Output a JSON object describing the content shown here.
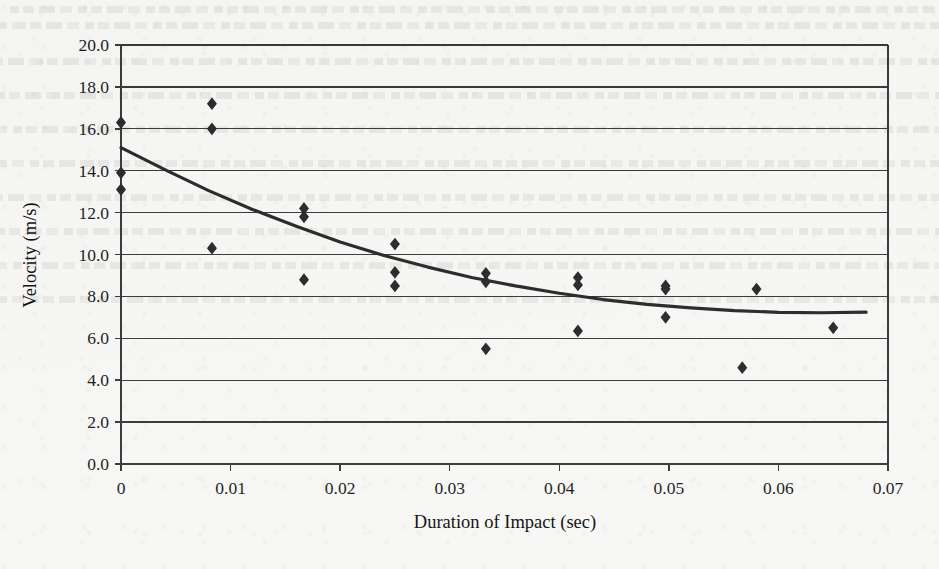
{
  "page": {
    "background_color": "#f7f7f5",
    "ghost_text_note": "faint show-through text from reverse of scanned page"
  },
  "chart_data": {
    "type": "scatter",
    "title": "",
    "xlabel": "Duration of Impact (sec)",
    "ylabel": "Velocity (m/s)",
    "xlim": [
      0,
      0.07
    ],
    "ylim": [
      0,
      20
    ],
    "xticks": [
      "0",
      "0.01",
      "0.02",
      "0.03",
      "0.04",
      "0.05",
      "0.06",
      "0.07"
    ],
    "xtick_values": [
      0,
      0.01,
      0.02,
      0.03,
      0.04,
      0.05,
      0.06,
      0.07
    ],
    "yticks": [
      "0.0",
      "2.0",
      "4.0",
      "6.0",
      "8.0",
      "10.0",
      "12.0",
      "14.0",
      "16.0",
      "18.0",
      "20.0"
    ],
    "ytick_values": [
      0,
      2,
      4,
      6,
      8,
      10,
      12,
      14,
      16,
      18,
      20
    ],
    "grid": "horizontal",
    "legend": "none",
    "marker": "diamond",
    "marker_color": "#2b2b2b",
    "line_color": "#2b2b2b",
    "points": [
      {
        "x": 0.0,
        "y": 16.3
      },
      {
        "x": 0.0,
        "y": 13.9
      },
      {
        "x": 0.0,
        "y": 13.1
      },
      {
        "x": 0.0083,
        "y": 17.2
      },
      {
        "x": 0.0083,
        "y": 16.0
      },
      {
        "x": 0.0083,
        "y": 10.3
      },
      {
        "x": 0.0167,
        "y": 12.2
      },
      {
        "x": 0.0167,
        "y": 11.8
      },
      {
        "x": 0.0167,
        "y": 8.8
      },
      {
        "x": 0.025,
        "y": 10.5
      },
      {
        "x": 0.025,
        "y": 9.15
      },
      {
        "x": 0.025,
        "y": 8.5
      },
      {
        "x": 0.0333,
        "y": 9.1
      },
      {
        "x": 0.0333,
        "y": 8.7
      },
      {
        "x": 0.0333,
        "y": 5.5
      },
      {
        "x": 0.0417,
        "y": 8.9
      },
      {
        "x": 0.0417,
        "y": 8.55
      },
      {
        "x": 0.0417,
        "y": 6.35
      },
      {
        "x": 0.0497,
        "y": 8.5
      },
      {
        "x": 0.0497,
        "y": 8.35
      },
      {
        "x": 0.0497,
        "y": 7.0
      },
      {
        "x": 0.0567,
        "y": 4.6
      },
      {
        "x": 0.058,
        "y": 8.35
      },
      {
        "x": 0.065,
        "y": 6.5
      }
    ],
    "trend_line": {
      "name": "fitted decay curve",
      "points": [
        {
          "x": 0.0,
          "y": 15.1
        },
        {
          "x": 0.004,
          "y": 14.05
        },
        {
          "x": 0.008,
          "y": 13.05
        },
        {
          "x": 0.012,
          "y": 12.15
        },
        {
          "x": 0.016,
          "y": 11.35
        },
        {
          "x": 0.02,
          "y": 10.6
        },
        {
          "x": 0.024,
          "y": 9.95
        },
        {
          "x": 0.028,
          "y": 9.4
        },
        {
          "x": 0.032,
          "y": 8.9
        },
        {
          "x": 0.036,
          "y": 8.5
        },
        {
          "x": 0.04,
          "y": 8.15
        },
        {
          "x": 0.044,
          "y": 7.85
        },
        {
          "x": 0.048,
          "y": 7.62
        },
        {
          "x": 0.052,
          "y": 7.45
        },
        {
          "x": 0.056,
          "y": 7.32
        },
        {
          "x": 0.06,
          "y": 7.24
        },
        {
          "x": 0.064,
          "y": 7.22
        },
        {
          "x": 0.068,
          "y": 7.25
        }
      ]
    }
  }
}
